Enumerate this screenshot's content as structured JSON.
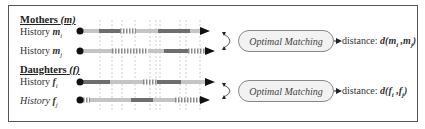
{
  "groups": [
    {
      "title": "Mothers",
      "symbol": "(m)",
      "histories": [
        {
          "label": "History ",
          "var": "m",
          "sub": "i",
          "italic": false
        },
        {
          "label": "History ",
          "var": "m",
          "sub": "j",
          "italic": false
        }
      ],
      "matcher_label": "Optimal Matching",
      "distance_label": "distance:",
      "distance_formula": "d(mi ,mj)"
    },
    {
      "title": "Daughters",
      "symbol": "(f)",
      "histories": [
        {
          "label": "History ",
          "var": "f",
          "sub": "i",
          "italic": false
        },
        {
          "label": "History ",
          "var": "f",
          "sub": "j",
          "italic": true
        }
      ],
      "matcher_label": "Optimal Matching",
      "distance_label": "distance:",
      "distance_formula": "d(fi ,fj)"
    }
  ],
  "timelines": [
    {
      "y": 31,
      "end": 210,
      "segments": [
        [
          80,
          99,
          "light"
        ],
        [
          99,
          120,
          "dark"
        ],
        [
          120,
          136,
          "dash"
        ],
        [
          136,
          158,
          "light"
        ],
        [
          158,
          190,
          "dark"
        ],
        [
          190,
          205,
          "light"
        ]
      ]
    },
    {
      "y": 51,
      "end": 215,
      "segments": [
        [
          80,
          112,
          "light"
        ],
        [
          112,
          148,
          "dash"
        ],
        [
          148,
          164,
          "light"
        ],
        [
          164,
          188,
          "dark"
        ],
        [
          188,
          205,
          "dash"
        ]
      ]
    },
    {
      "y": 82,
      "end": 215,
      "segments": [
        [
          80,
          110,
          "dark"
        ],
        [
          110,
          143,
          "light"
        ],
        [
          143,
          157,
          "dash"
        ],
        [
          157,
          181,
          "dark"
        ],
        [
          181,
          205,
          "light"
        ]
      ]
    },
    {
      "y": 100,
      "end": 210,
      "segments": [
        [
          80,
          90,
          "dash"
        ],
        [
          90,
          131,
          "light"
        ],
        [
          131,
          153,
          "dark"
        ],
        [
          153,
          175,
          "light"
        ],
        [
          175,
          200,
          "dash"
        ]
      ]
    }
  ],
  "gridlines_x": [
    100,
    112,
    122,
    135,
    150,
    156,
    160,
    180,
    186,
    200
  ],
  "colors": {
    "dark": "#6e6e6e",
    "light": "#c4c4c4",
    "dash": "#8a8a8a",
    "frame": "#555555",
    "arrow": "#111111"
  }
}
